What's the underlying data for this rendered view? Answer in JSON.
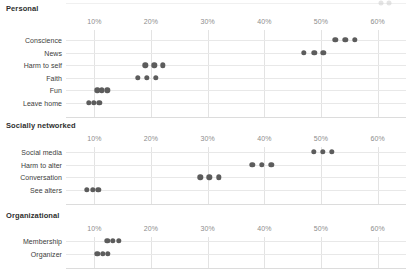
{
  "chart_data": {
    "type": "scatter",
    "title": "",
    "xlabel": "",
    "ylabel": "",
    "xlim": [
      5,
      65
    ],
    "xticks": [
      10,
      20,
      30,
      40,
      50,
      60
    ],
    "xtick_labels": [
      "10%",
      "20%",
      "30%",
      "40%",
      "50%",
      "60%"
    ],
    "grid": true,
    "legend": "none",
    "dot_color": "#5c5c5c",
    "gridline_color": "#e3e3e3",
    "panels": [
      {
        "id": "personal",
        "title": "Personal",
        "categories": [
          {
            "label": "Conscience",
            "values": [
              52.5,
              54.3,
              56.0
            ]
          },
          {
            "label": "News",
            "values": [
              47.0,
              48.8,
              50.4
            ]
          },
          {
            "label": "Harm to self",
            "values": [
              19.0,
              20.6,
              22.1
            ]
          },
          {
            "label": "Faith",
            "values": [
              17.7,
              19.3,
              20.9
            ]
          },
          {
            "label": "Fun",
            "values": [
              10.5,
              11.3,
              12.3
            ]
          },
          {
            "label": "Leave home",
            "values": [
              9.0,
              9.9,
              10.9
            ]
          }
        ]
      },
      {
        "id": "socially-networked",
        "title": "Socially networked",
        "categories": [
          {
            "label": "Social media",
            "values": [
              48.7,
              50.3,
              51.9
            ]
          },
          {
            "label": "Harm to alter",
            "values": [
              37.9,
              39.5,
              41.2
            ]
          },
          {
            "label": "Conversation",
            "values": [
              28.7,
              30.3,
              32.0
            ]
          },
          {
            "label": "See alters",
            "values": [
              8.7,
              9.7,
              10.7
            ]
          }
        ]
      },
      {
        "id": "organizational",
        "title": "Organizational",
        "categories": [
          {
            "label": "Membership",
            "values": [
              12.3,
              13.3,
              14.3
            ]
          },
          {
            "label": "Organizer",
            "values": [
              10.5,
              11.5,
              12.4
            ]
          }
        ]
      }
    ]
  },
  "layout": {
    "plot_left": 66,
    "plot_right": 406,
    "panels": [
      {
        "top": 4,
        "title_top": 4,
        "axis_top": 18,
        "first_row": 40,
        "row_step": 12.6,
        "baseline_extra": 14
      },
      {
        "top": 121,
        "title_top": 121,
        "axis_top": 135,
        "first_row": 152,
        "row_step": 12.6,
        "baseline_extra": 14
      },
      {
        "top": 211,
        "title_top": 211,
        "axis_top": 225,
        "first_row": 241,
        "row_step": 12.6,
        "baseline_extra": 14
      }
    ]
  },
  "ghost": {
    "dots": [
      60.5,
      62.0
    ],
    "note": "faint cut-off row from preceding panel"
  }
}
